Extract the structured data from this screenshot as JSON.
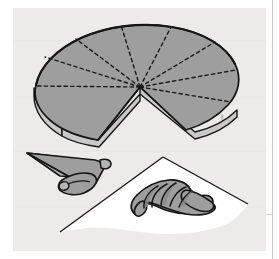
{
  "figure": {
    "title": "Croissant shaping diagram",
    "description": "Technical illustration showing a round sheet of dough marked into triangular wedges, a partially rolled dough triangle, and a finished crescent-shaped croissant resting on a sheet of paper.",
    "canvas": {
      "width": 279,
      "height": 259
    },
    "colors": {
      "page_background": "#ffffff",
      "scan_background": "#ededeb",
      "dough_fill": "#9e9e9e",
      "dough_shadow": "#8a8a8a",
      "dough_highlight": "#b5b5b5",
      "paper_fill": "#ffffff",
      "outline": "#161616",
      "dashed_line": "#1a1a1a",
      "edge_band": "#c9c9c9",
      "frame_rule": "#c8c8c8"
    },
    "parts": [
      {
        "id": "dough-disc",
        "label": "Round sheet of dough marked into wedges",
        "wedge_count": 8,
        "removed_wedge": 1,
        "notes": "Dashed radial lines indicate cut marks from centre to rim; one wedge has been cut away leaving a V notch at the lower front."
      },
      {
        "id": "rolling-triangle",
        "label": "Dough triangle partly rolled from the wide base",
        "notes": "Shown mid-roll with the rolled cylinder at the wide end and the point still flat."
      },
      {
        "id": "finished-croissant",
        "label": "Finished crescent-shaped croissant",
        "layer_count": 5,
        "notes": "Curved into a crescent with visible overlapping rolled layers and tapered tips."
      },
      {
        "id": "paper-sheet",
        "label": "Sheet of paper under the finished croissant",
        "notes": "White quadrilateral receding in perspective beneath the croissant."
      }
    ],
    "frame": {
      "right_rule_x": 272,
      "visible": true
    }
  }
}
